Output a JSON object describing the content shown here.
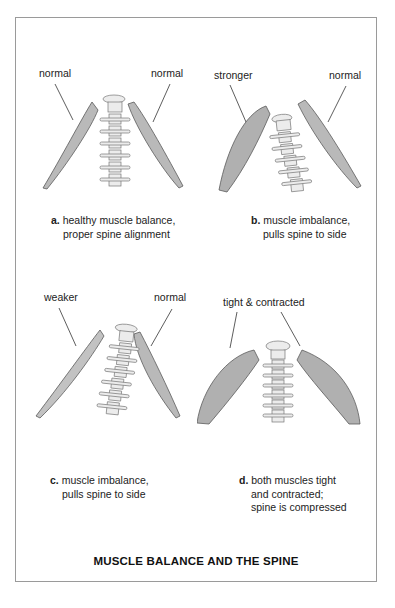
{
  "title": "MUSCLE BALANCE AND THE SPINE",
  "colors": {
    "frame_border": "#9a9a9a",
    "muscle_fill": "#b9b9b9",
    "muscle_stroke": "#5a5a5a",
    "bone_fill": "#ececec",
    "text": "#222222"
  },
  "panels": [
    {
      "id": "a",
      "left_label": "normal",
      "right_label": "normal",
      "caption_letter": "a.",
      "caption_lines": [
        "healthy muscle balance,",
        "proper spine alignment"
      ]
    },
    {
      "id": "b",
      "left_label": "stronger",
      "right_label": "normal",
      "caption_letter": "b.",
      "caption_lines": [
        "muscle imbalance,",
        "pulls spine to side"
      ]
    },
    {
      "id": "c",
      "left_label": "weaker",
      "right_label": "normal",
      "caption_letter": "c.",
      "caption_lines": [
        "muscle imbalance,",
        "pulls spine to side"
      ]
    },
    {
      "id": "d",
      "top_label": "tight & contracted",
      "caption_letter": "d.",
      "caption_lines": [
        "both muscles tight",
        "and contracted;",
        "spine is compressed"
      ]
    }
  ]
}
